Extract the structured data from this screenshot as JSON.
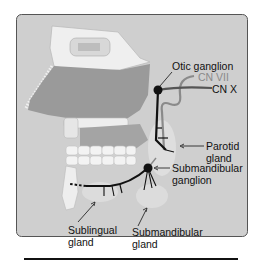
{
  "diagram": {
    "type": "anatomical",
    "colors": {
      "panel_background": "#cfcfcf",
      "border": "#555555",
      "nerve": "#111111",
      "cn_vii": "#8a8a8a",
      "cn_x": "#555555",
      "tongue": "#9a9a9a",
      "bone": "#efefef",
      "gland": "#dedede"
    },
    "labels": {
      "otic_ganglion": "Otic ganglion",
      "cn_vii": "CN VII",
      "cn_x": "CN X",
      "parotid_gland_line1": "Parotid",
      "parotid_gland_line2": "gland",
      "submandibular_ganglion_line1": "Submandibular",
      "submandibular_ganglion_line2": "ganglion",
      "sublingual_gland_line1": "Sublingual",
      "sublingual_gland_line2": "gland",
      "submandibular_gland_line1": "Submandibular",
      "submandibular_gland_line2": "gland"
    }
  }
}
